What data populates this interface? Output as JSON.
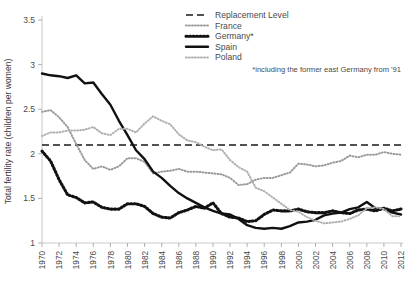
{
  "chart_data": {
    "type": "line",
    "title": "",
    "xlabel": "",
    "ylabel": "Total fertility rate (children per women)",
    "xlim": [
      1970,
      2012
    ],
    "ylim": [
      1,
      3.5
    ],
    "yticks": [
      "1",
      "1.5",
      "2",
      "2.5",
      "3",
      "3.5"
    ],
    "ytick_values": [
      1,
      1.5,
      2,
      2.5,
      3,
      3.5
    ],
    "xticks": [
      "1970",
      "1972",
      "1974",
      "1976",
      "1978",
      "1980",
      "1982",
      "1984",
      "1986",
      "1988",
      "1990",
      "1992",
      "1994",
      "1996",
      "1998",
      "2000",
      "2002",
      "2004",
      "2006",
      "2008",
      "2010",
      "2012"
    ],
    "xtick_values": [
      1970,
      1972,
      1974,
      1976,
      1978,
      1980,
      1982,
      1984,
      1986,
      1988,
      1990,
      1992,
      1994,
      1996,
      1998,
      2000,
      2002,
      2004,
      2006,
      2008,
      2010,
      2012
    ],
    "grid": false,
    "legend_position": "top-right",
    "x": [
      1970,
      1971,
      1972,
      1973,
      1974,
      1975,
      1976,
      1977,
      1978,
      1979,
      1980,
      1981,
      1982,
      1983,
      1984,
      1985,
      1986,
      1987,
      1988,
      1989,
      1990,
      1991,
      1992,
      1993,
      1994,
      1995,
      1996,
      1997,
      1998,
      1999,
      2000,
      2001,
      2002,
      2003,
      2004,
      2005,
      2006,
      2007,
      2008,
      2009,
      2010,
      2011,
      2012
    ],
    "series": [
      {
        "name": "Replacement Level",
        "style": "dashed",
        "color": "#1a1a1a",
        "constant": 2.1,
        "values": [
          2.1,
          2.1,
          2.1,
          2.1,
          2.1,
          2.1,
          2.1,
          2.1,
          2.1,
          2.1,
          2.1,
          2.1,
          2.1,
          2.1,
          2.1,
          2.1,
          2.1,
          2.1,
          2.1,
          2.1,
          2.1,
          2.1,
          2.1,
          2.1,
          2.1,
          2.1,
          2.1,
          2.1,
          2.1,
          2.1,
          2.1,
          2.1,
          2.1,
          2.1,
          2.1,
          2.1,
          2.1,
          2.1,
          2.1,
          2.1,
          2.1,
          2.1,
          2.1
        ]
      },
      {
        "name": "France",
        "style": "fine-dotted",
        "color": "#9a9a9a",
        "values": [
          2.47,
          2.49,
          2.41,
          2.3,
          2.11,
          1.93,
          1.83,
          1.86,
          1.82,
          1.86,
          1.95,
          1.95,
          1.91,
          1.78,
          1.8,
          1.81,
          1.83,
          1.8,
          1.8,
          1.79,
          1.78,
          1.77,
          1.73,
          1.65,
          1.66,
          1.71,
          1.73,
          1.73,
          1.76,
          1.79,
          1.89,
          1.88,
          1.86,
          1.87,
          1.9,
          1.92,
          1.98,
          1.96,
          1.99,
          1.99,
          2.02,
          2.0,
          1.99
        ]
      },
      {
        "name": "Germany*",
        "style": "thick-dotted",
        "color": "#111111",
        "values": [
          2.03,
          1.92,
          1.71,
          1.54,
          1.51,
          1.45,
          1.46,
          1.4,
          1.38,
          1.38,
          1.44,
          1.44,
          1.41,
          1.33,
          1.29,
          1.28,
          1.34,
          1.37,
          1.41,
          1.39,
          1.45,
          1.33,
          1.29,
          1.28,
          1.24,
          1.25,
          1.32,
          1.37,
          1.36,
          1.36,
          1.38,
          1.35,
          1.34,
          1.34,
          1.36,
          1.34,
          1.33,
          1.37,
          1.38,
          1.36,
          1.39,
          1.36,
          1.38
        ]
      },
      {
        "name": "Spain",
        "style": "solid",
        "color": "#111111",
        "values": [
          2.9,
          2.88,
          2.87,
          2.85,
          2.88,
          2.79,
          2.8,
          2.67,
          2.55,
          2.37,
          2.21,
          2.04,
          1.94,
          1.8,
          1.73,
          1.64,
          1.56,
          1.5,
          1.45,
          1.4,
          1.36,
          1.33,
          1.32,
          1.27,
          1.2,
          1.17,
          1.16,
          1.17,
          1.16,
          1.19,
          1.23,
          1.24,
          1.26,
          1.31,
          1.33,
          1.34,
          1.38,
          1.4,
          1.46,
          1.39,
          1.38,
          1.34,
          1.32
        ]
      },
      {
        "name": "Poland",
        "style": "fine-dotted",
        "color": "#b0b0b0",
        "values": [
          2.2,
          2.24,
          2.24,
          2.26,
          2.26,
          2.27,
          2.3,
          2.23,
          2.21,
          2.28,
          2.28,
          2.24,
          2.34,
          2.42,
          2.37,
          2.33,
          2.22,
          2.15,
          2.13,
          2.08,
          2.04,
          2.05,
          1.93,
          1.85,
          1.8,
          1.62,
          1.58,
          1.51,
          1.44,
          1.37,
          1.35,
          1.29,
          1.25,
          1.22,
          1.23,
          1.24,
          1.27,
          1.31,
          1.39,
          1.4,
          1.38,
          1.3,
          1.3
        ]
      }
    ],
    "annotations": [
      {
        "name": "germany-footnote",
        "text": "*including the former east Germany from '91"
      }
    ]
  },
  "legend": {
    "items": [
      {
        "label": "Replacement Level",
        "swatch": "dashed-line-swatch"
      },
      {
        "label": "France",
        "swatch": "fine-dotted-line-swatch"
      },
      {
        "label": "Germany*",
        "swatch": "thick-dotted-line-swatch"
      },
      {
        "label": "Spain",
        "swatch": "solid-line-swatch"
      },
      {
        "label": "Poland",
        "swatch": "fine-dotted-line-swatch"
      }
    ]
  }
}
